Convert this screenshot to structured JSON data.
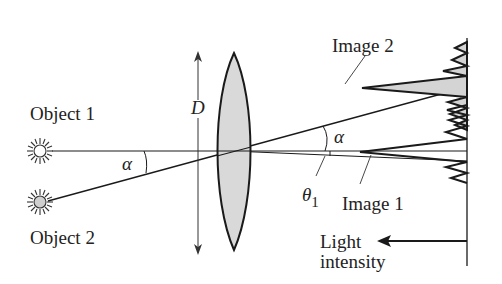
{
  "diagram": {
    "labels": {
      "object1": "Object 1",
      "object2": "Object 2",
      "image1": "Image 1",
      "image2": "Image 2",
      "aperture": "D",
      "alpha_left": "α",
      "alpha_right": "α",
      "theta": "θ",
      "theta_subscript": "1",
      "intensity_line1": "Light",
      "intensity_line2": "intensity"
    },
    "colors": {
      "stroke": "#1a1a1a",
      "lens_fill": "#d9d9d9",
      "peak_fill": "#d4d4d4",
      "object2_fill": "#cfcfcf",
      "background": "#ffffff"
    }
  }
}
